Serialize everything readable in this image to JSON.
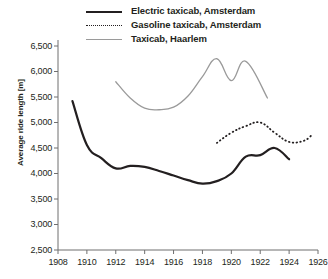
{
  "chart_data": {
    "type": "line",
    "title": "",
    "xlabel": "",
    "ylabel": "Average ride length [m]",
    "xlim": [
      1908,
      1926
    ],
    "ylim": [
      2500,
      6500
    ],
    "xticks": [
      1908,
      1910,
      1912,
      1914,
      1916,
      1918,
      1920,
      1922,
      1924,
      1926
    ],
    "yticks": [
      2500,
      3000,
      3500,
      4000,
      4500,
      5000,
      5500,
      6000,
      6500
    ],
    "grid": false,
    "legend_position": "top-center",
    "series": [
      {
        "name": "Electric taxicab, Amsterdam",
        "style": "solid",
        "color": "#231f20",
        "width": 2.2,
        "x": [
          1909.0,
          1910.0,
          1911.0,
          1912.0,
          1913.0,
          1914.0,
          1915.0,
          1916.0,
          1917.0,
          1918.0,
          1919.0,
          1920.0,
          1921.0,
          1922.0,
          1923.0,
          1924.0
        ],
        "y": [
          5420,
          4560,
          4300,
          4100,
          4150,
          4130,
          4050,
          3960,
          3870,
          3800,
          3850,
          4000,
          4330,
          4360,
          4500,
          4280
        ]
      },
      {
        "name": "Gasoline taxicab, Amsterdam",
        "style": "dotted",
        "color": "#231f20",
        "width": 1.8,
        "x": [
          1919.0,
          1920.0,
          1921.0,
          1922.0,
          1923.0,
          1924.0,
          1925.0,
          1925.6
        ],
        "y": [
          4600,
          4800,
          4930,
          5000,
          4800,
          4620,
          4640,
          4760
        ]
      },
      {
        "name": "Taxicab, Haarlem",
        "style": "solid",
        "color": "#9a9a9a",
        "width": 1.3,
        "x": [
          1912.0,
          1913.0,
          1914.0,
          1915.0,
          1916.0,
          1917.0,
          1918.0,
          1919.0,
          1920.0,
          1921.0,
          1922.5
        ],
        "y": [
          5800,
          5480,
          5280,
          5250,
          5300,
          5520,
          5900,
          6250,
          5820,
          6200,
          5480
        ]
      }
    ]
  },
  "legend": {
    "items": [
      {
        "label": "Electric taxicab, Amsterdam",
        "swatch": "solid-black"
      },
      {
        "label": "Gasoline taxicab, Amsterdam",
        "swatch": "dotted-black"
      },
      {
        "label": "Taxicab, Haarlem",
        "swatch": "solid-gray"
      }
    ]
  },
  "axis": {
    "y_title": "Average ride length [m]",
    "y_labels": [
      "6,500",
      "6,000",
      "5,500",
      "5,000",
      "4,500",
      "4,000",
      "3,500",
      "3,000",
      "2,500"
    ],
    "x_labels": [
      "1908",
      "1910",
      "1912",
      "1914",
      "1916",
      "1918",
      "1920",
      "1922",
      "1924",
      "1926"
    ]
  },
  "colors": {
    "axis": "#6f6f6f",
    "series_primary": "#231f20",
    "series_gray": "#9a9a9a",
    "background": "#ffffff"
  }
}
